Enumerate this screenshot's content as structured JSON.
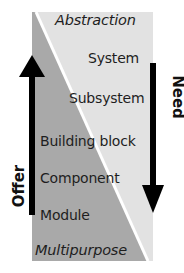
{
  "diagram": {
    "top_label": "Abstraction",
    "bottom_label": "Multipurpose",
    "levels": [
      {
        "label": "System"
      },
      {
        "label": "Subsystem"
      },
      {
        "label": "Building block"
      },
      {
        "label": "Component"
      },
      {
        "label": "Module"
      }
    ],
    "left_arrow": {
      "label": "Offer",
      "direction": "up"
    },
    "right_arrow": {
      "label": "Need",
      "direction": "down"
    },
    "colors": {
      "dark_region": "#a9a9a9",
      "light_region": "#e2e2e2",
      "divider": "#ffffff",
      "arrow": "#000000"
    }
  }
}
